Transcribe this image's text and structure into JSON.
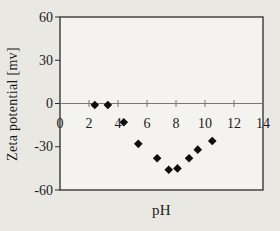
{
  "figure": {
    "background_color": "#eae8e3",
    "plot_background_color": "#f4f3ef",
    "axis_color": "#2b2b2b",
    "zero_line_color": "#777777",
    "tick_color": "#555555",
    "marker_color": "#0d0d0d",
    "text_color": "#1a1a1a"
  },
  "chart_data": {
    "type": "scatter",
    "title": "",
    "xlabel": "pH",
    "ylabel": "Zeta potential [mv]",
    "xlim": [
      0,
      14
    ],
    "ylim": [
      -60,
      60
    ],
    "x_ticks": [
      0,
      2,
      4,
      6,
      8,
      10,
      12,
      14
    ],
    "y_ticks": [
      60,
      30,
      0,
      "-30",
      "-60"
    ],
    "y_tick_values": [
      60,
      30,
      0,
      -30,
      -60
    ],
    "grid": false,
    "legend_position": "none",
    "marker": "diamond",
    "series": [
      {
        "name": "zeta-potential-vs-ph",
        "x": [
          2.4,
          3.3,
          4.4,
          5.4,
          6.7,
          7.5,
          8.1,
          8.9,
          9.5,
          10.5
        ],
        "y": [
          -1,
          -1,
          -13,
          -28,
          -38,
          -46,
          -45,
          -38,
          -32,
          -26
        ]
      }
    ]
  }
}
